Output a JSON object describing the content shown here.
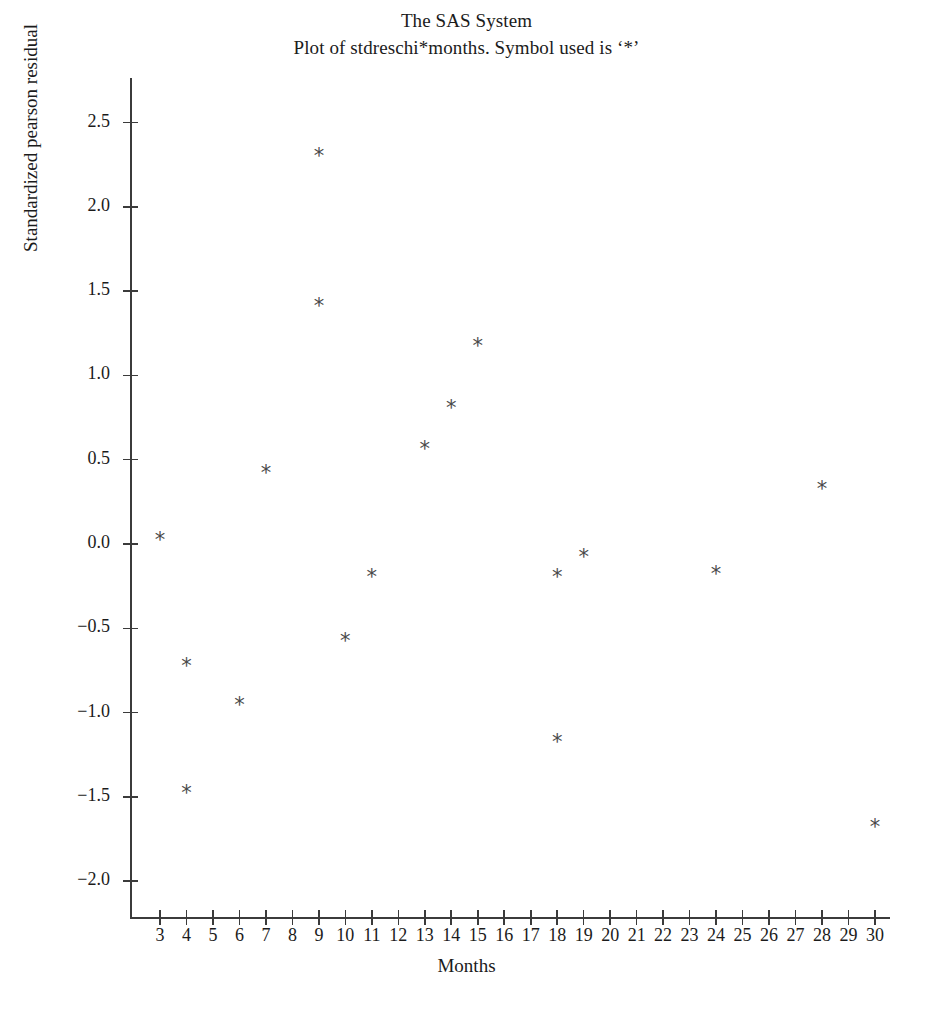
{
  "title": {
    "line1": "The SAS System",
    "line2": "Plot of stdreschi*months. Symbol used is ‘*’"
  },
  "chart_data": {
    "type": "scatter",
    "title": "The SAS System",
    "subtitle": "Plot of stdreschi*months. Symbol used is ‘*’",
    "xlabel": "Months",
    "ylabel": "Standardized pearson residual",
    "marker_symbol": "*",
    "grid": false,
    "legend": null,
    "xlim": [
      2.0,
      31.5
    ],
    "ylim": [
      -2.25,
      2.75
    ],
    "xticks": [
      3,
      4,
      5,
      6,
      7,
      8,
      9,
      10,
      11,
      12,
      13,
      14,
      15,
      16,
      17,
      18,
      19,
      20,
      21,
      22,
      23,
      24,
      25,
      26,
      27,
      28,
      29,
      30
    ],
    "xtick_labels": [
      "3",
      "4",
      "5",
      "6",
      "7",
      "8",
      "9",
      "10",
      "11",
      "12",
      "13",
      "14",
      "15",
      "16",
      "17",
      "18",
      "19",
      "20",
      "21",
      "22",
      "23",
      "24",
      "25",
      "26",
      "27",
      "28",
      "29",
      "30"
    ],
    "yticks": [
      2.5,
      2.0,
      1.5,
      1.0,
      0.5,
      0.0,
      -0.5,
      -1.0,
      -1.5,
      -2.0
    ],
    "ytick_labels": [
      "2.5",
      "2.0",
      "1.5",
      "1.0",
      "0.5",
      "0.0",
      "−0.5",
      "−1.0",
      "−1.5",
      "−2.0"
    ],
    "x": [
      3,
      4,
      4,
      6,
      7,
      9,
      9,
      10,
      11,
      13,
      14,
      15,
      18,
      18,
      19,
      24,
      28,
      30
    ],
    "y": [
      0.0,
      -0.75,
      -1.5,
      -0.98,
      0.4,
      2.28,
      1.39,
      -0.6,
      -0.22,
      0.54,
      0.78,
      1.15,
      -0.22,
      -1.2,
      -0.1,
      -0.2,
      0.3,
      -1.7
    ],
    "points": [
      {
        "x": 3,
        "y": 0.0
      },
      {
        "x": 4,
        "y": -0.75
      },
      {
        "x": 4,
        "y": -1.5
      },
      {
        "x": 6,
        "y": -0.98
      },
      {
        "x": 7,
        "y": 0.4
      },
      {
        "x": 9,
        "y": 2.28
      },
      {
        "x": 9,
        "y": 1.39
      },
      {
        "x": 10,
        "y": -0.6
      },
      {
        "x": 11,
        "y": -0.22
      },
      {
        "x": 13,
        "y": 0.54
      },
      {
        "x": 14,
        "y": 0.78
      },
      {
        "x": 15,
        "y": 1.15
      },
      {
        "x": 18,
        "y": -0.22
      },
      {
        "x": 18,
        "y": -1.2
      },
      {
        "x": 19,
        "y": -0.1
      },
      {
        "x": 24,
        "y": -0.2
      },
      {
        "x": 28,
        "y": 0.3
      },
      {
        "x": 30,
        "y": -1.7
      }
    ],
    "colors": {
      "marker": "#4a4a4a",
      "axis": "#3b3b3b",
      "text": "#1b1b1b",
      "background": "#ffffff"
    }
  }
}
